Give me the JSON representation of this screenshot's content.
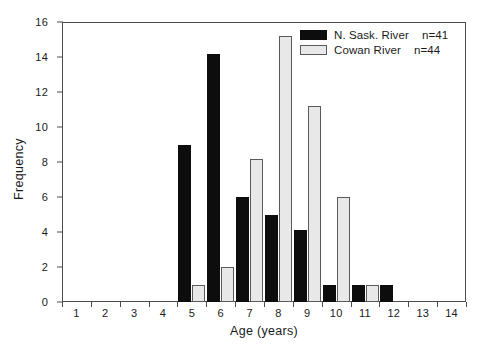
{
  "chart_data": {
    "type": "bar",
    "title": "",
    "subtitle": "",
    "xlabel": "Age (years)",
    "ylabel": "Frequency",
    "categories": [
      "1",
      "2",
      "3",
      "4",
      "5",
      "6",
      "7",
      "8",
      "9",
      "10",
      "11",
      "12",
      "13",
      "14"
    ],
    "xlim": [
      0.5,
      14.5
    ],
    "ylim": [
      0,
      16
    ],
    "yticks": [
      "0",
      "2",
      "4",
      "6",
      "8",
      "10",
      "12",
      "14",
      "16"
    ],
    "grid": false,
    "legend_position": "top-right",
    "series": [
      {
        "name": "N. Sask. River",
        "n_label": "n=41",
        "color": "#0d0d0d",
        "values": [
          0,
          0,
          0,
          0,
          9,
          14.2,
          6,
          5,
          4.1,
          1,
          1,
          1,
          0,
          0
        ]
      },
      {
        "name": "Cowan River",
        "n_label": "n=44",
        "color": "#e8e8e8",
        "values": [
          0,
          0,
          0,
          0,
          1,
          2,
          8.2,
          15.2,
          11.2,
          6,
          1,
          0,
          0,
          0
        ]
      }
    ]
  },
  "legend": {
    "items": [
      {
        "label": "N. Sask. River",
        "count": "n=41"
      },
      {
        "label": "Cowan River",
        "count": "n=44"
      }
    ]
  },
  "axes": {
    "y_title": "Frequency",
    "x_title": "Age (years)"
  }
}
